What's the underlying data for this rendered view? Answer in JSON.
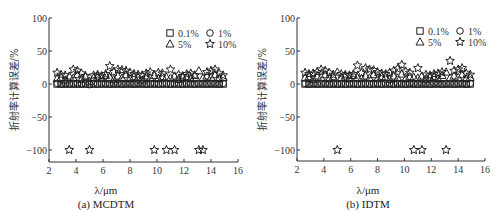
{
  "chart_data": [
    {
      "type": "scatter",
      "panel_id": "a",
      "title": "(a) MCDTM",
      "xlabel": "λ/μm",
      "ylabel": "折射率计算误差/%",
      "xlim": [
        2,
        16
      ],
      "ylim": [
        -118,
        100
      ],
      "xticks": [
        2,
        4,
        6,
        8,
        10,
        12,
        14,
        16
      ],
      "yticks": [
        100,
        50,
        0,
        -50,
        -100
      ],
      "grid": false,
      "legend_position": "upper right",
      "legend": [
        {
          "name": "0.1%",
          "marker": "square"
        },
        {
          "name": "1%",
          "marker": "circle"
        },
        {
          "name": "5%",
          "marker": "triangle"
        },
        {
          "name": "10%",
          "marker": "star"
        }
      ],
      "x": [
        2.6,
        2.9,
        3.2,
        3.5,
        3.8,
        4.1,
        4.4,
        4.7,
        5.0,
        5.3,
        5.6,
        5.9,
        6.2,
        6.5,
        6.8,
        7.1,
        7.4,
        7.7,
        8.0,
        8.3,
        8.6,
        8.9,
        9.2,
        9.5,
        9.8,
        10.1,
        10.4,
        10.7,
        11.0,
        11.3,
        11.6,
        11.9,
        12.2,
        12.5,
        12.8,
        13.1,
        13.4,
        13.7,
        14.0,
        14.3,
        14.6,
        14.9
      ],
      "series": [
        {
          "name": "0.1%",
          "values": [
            0,
            0,
            0,
            0,
            0,
            0,
            0,
            0,
            0,
            0,
            0,
            0,
            0,
            0,
            0,
            0,
            0,
            0,
            0,
            0,
            0,
            0,
            0,
            0,
            0,
            0,
            0,
            0,
            0,
            0,
            0,
            0,
            0,
            0,
            0,
            0,
            0,
            0,
            0,
            0,
            0,
            0
          ]
        },
        {
          "name": "1%",
          "values": [
            1,
            0,
            1,
            0,
            1,
            1,
            0,
            1,
            -1,
            1,
            0,
            1,
            1,
            0,
            1,
            1,
            0,
            1,
            1,
            0,
            1,
            1,
            0,
            1,
            1,
            0,
            1,
            1,
            0,
            1,
            1,
            0,
            1,
            1,
            0,
            1,
            1,
            0,
            1,
            1,
            0,
            1
          ]
        },
        {
          "name": "5%",
          "values": [
            8,
            10,
            6,
            12,
            9,
            14,
            7,
            11,
            4,
            9,
            12,
            8,
            13,
            10,
            7,
            12,
            9,
            14,
            8,
            11,
            10,
            6,
            12,
            9,
            13,
            8,
            11,
            10,
            9,
            12,
            7,
            10,
            11,
            8,
            13,
            20,
            9,
            12,
            10,
            14,
            8,
            10
          ]
        },
        {
          "name": "10%",
          "values": [
            17,
            14,
            13,
            -100,
            22,
            20,
            16,
            12,
            -100,
            13,
            14,
            12,
            15,
            27,
            18,
            22,
            21,
            20,
            17,
            15,
            14,
            13,
            16,
            18,
            -100,
            17,
            16,
            -100,
            22,
            -100,
            14,
            12,
            15,
            16,
            13,
            -100,
            -100,
            18,
            20,
            22,
            16,
            13
          ]
        }
      ]
    },
    {
      "type": "scatter",
      "panel_id": "b",
      "title": "(b) IDTM",
      "xlabel": "λ/μm",
      "ylabel": "折射率计算误差/%",
      "xlim": [
        2,
        16
      ],
      "ylim": [
        -118,
        100
      ],
      "xticks": [
        2,
        4,
        6,
        8,
        10,
        12,
        14,
        16
      ],
      "yticks": [
        100,
        50,
        0,
        -50,
        -100
      ],
      "grid": false,
      "legend_position": "upper right",
      "legend": [
        {
          "name": "0.1%",
          "marker": "square"
        },
        {
          "name": "1%",
          "marker": "circle"
        },
        {
          "name": "5%",
          "marker": "triangle"
        },
        {
          "name": "10%",
          "marker": "star"
        }
      ],
      "x": [
        2.6,
        2.9,
        3.2,
        3.5,
        3.8,
        4.1,
        4.4,
        4.7,
        5.0,
        5.3,
        5.6,
        5.9,
        6.2,
        6.5,
        6.8,
        7.1,
        7.4,
        7.7,
        8.0,
        8.3,
        8.6,
        8.9,
        9.2,
        9.5,
        9.8,
        10.1,
        10.4,
        10.7,
        11.0,
        11.3,
        11.6,
        11.9,
        12.2,
        12.5,
        12.8,
        13.1,
        13.4,
        13.7,
        14.0,
        14.3,
        14.6,
        14.9
      ],
      "series": [
        {
          "name": "0.1%",
          "values": [
            0,
            0,
            0,
            0,
            0,
            0,
            0,
            0,
            0,
            0,
            0,
            0,
            0,
            0,
            0,
            0,
            0,
            0,
            0,
            0,
            0,
            0,
            0,
            0,
            0,
            0,
            0,
            0,
            0,
            0,
            0,
            0,
            0,
            0,
            0,
            0,
            0,
            0,
            0,
            0,
            0,
            0
          ]
        },
        {
          "name": "1%",
          "values": [
            1,
            0,
            1,
            0,
            1,
            1,
            0,
            1,
            0,
            1,
            0,
            1,
            1,
            0,
            1,
            1,
            0,
            1,
            1,
            0,
            1,
            1,
            0,
            1,
            1,
            0,
            1,
            1,
            0,
            1,
            1,
            0,
            1,
            1,
            0,
            1,
            1,
            0,
            1,
            1,
            0,
            1
          ]
        },
        {
          "name": "5%",
          "values": [
            9,
            11,
            7,
            12,
            10,
            14,
            8,
            11,
            18,
            9,
            12,
            8,
            13,
            10,
            8,
            12,
            9,
            14,
            8,
            11,
            10,
            7,
            12,
            9,
            15,
            8,
            11,
            10,
            9,
            12,
            7,
            10,
            11,
            8,
            13,
            18,
            9,
            12,
            10,
            14,
            8,
            10
          ]
        },
        {
          "name": "10%",
          "values": [
            17,
            15,
            16,
            18,
            22,
            20,
            17,
            14,
            -100,
            15,
            14,
            13,
            15,
            28,
            17,
            24,
            22,
            21,
            18,
            16,
            15,
            17,
            20,
            23,
            29,
            19,
            17,
            -100,
            24,
            -100,
            14,
            13,
            15,
            16,
            18,
            -100,
            35,
            20,
            22,
            24,
            16,
            14
          ]
        }
      ]
    }
  ],
  "panels": {
    "a": {
      "caption": "(a) MCDTM",
      "xlabel": "λ/μm",
      "ylabel": "折射率计算误差/%"
    },
    "b": {
      "caption": "(b) IDTM",
      "xlabel": "λ/μm",
      "ylabel": "折射率计算误差/%"
    }
  },
  "legend_labels": [
    "0.1%",
    "1%",
    "5%",
    "10%"
  ],
  "colors": {
    "ink": "#222222",
    "background": "#ffffff"
  }
}
